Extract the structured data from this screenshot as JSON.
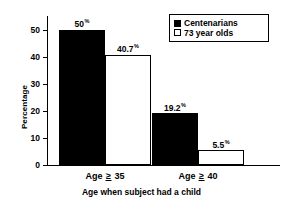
{
  "chart_data": {
    "type": "bar",
    "title": "",
    "xlabel": "Age when subject had a child",
    "ylabel": "Percentage",
    "categories": [
      "Age ≥ 35",
      "Age ≥ 40"
    ],
    "series": [
      {
        "name": "Centenarians",
        "values": [
          50,
          19.2
        ],
        "value_labels": [
          "50",
          "19.2"
        ],
        "fill": "#000000",
        "stroke": "#000000"
      },
      {
        "name": "73 year olds",
        "values": [
          40.7,
          5.5
        ],
        "value_labels": [
          "40.7",
          "5.5"
        ],
        "fill": "#ffffff",
        "stroke": "#000000"
      }
    ],
    "unit_symbol": "%",
    "ylim": [
      0,
      55
    ],
    "yticks": [
      0,
      10,
      20,
      30,
      40,
      50
    ],
    "ytick_labels": [
      "0",
      "10",
      "20",
      "30",
      "40",
      "50"
    ],
    "grid": false,
    "legend_position": "top-right"
  },
  "axis": {
    "y_title": "Percentage",
    "x_title": "Age when subject had a child",
    "ticks": [
      {
        "value": 50,
        "label": "50"
      },
      {
        "value": 40,
        "label": "40"
      },
      {
        "value": 30,
        "label": "30"
      },
      {
        "value": 20,
        "label": "20"
      },
      {
        "value": 10,
        "label": "10"
      },
      {
        "value": 0,
        "label": "0"
      }
    ]
  },
  "categories": [
    {
      "prefix": "Age",
      "relation": "≥",
      "value": "35"
    },
    {
      "prefix": "Age",
      "relation": "≥",
      "value": "40"
    }
  ],
  "bars": [
    {
      "series": "Centenarians",
      "category": "Age ≥ 35",
      "value": 50,
      "label": "50",
      "pct": "%"
    },
    {
      "series": "73 year olds",
      "category": "Age ≥ 35",
      "value": 40.7,
      "label": "40.7",
      "pct": "%"
    },
    {
      "series": "Centenarians",
      "category": "Age ≥ 40",
      "value": 19.2,
      "label": "19.2",
      "pct": "%"
    },
    {
      "series": "73 year olds",
      "category": "Age ≥ 40",
      "value": 5.5,
      "label": "5.5",
      "pct": "%"
    }
  ],
  "legend": {
    "items": [
      {
        "label": "Centenarians",
        "swatch": "filled-square"
      },
      {
        "label": "73 year olds",
        "swatch": "open-square"
      }
    ]
  },
  "colors": {
    "background": "#ffffff",
    "foreground": "#000000",
    "series_centenarians": "#000000",
    "series_73_year_olds": "#ffffff"
  }
}
